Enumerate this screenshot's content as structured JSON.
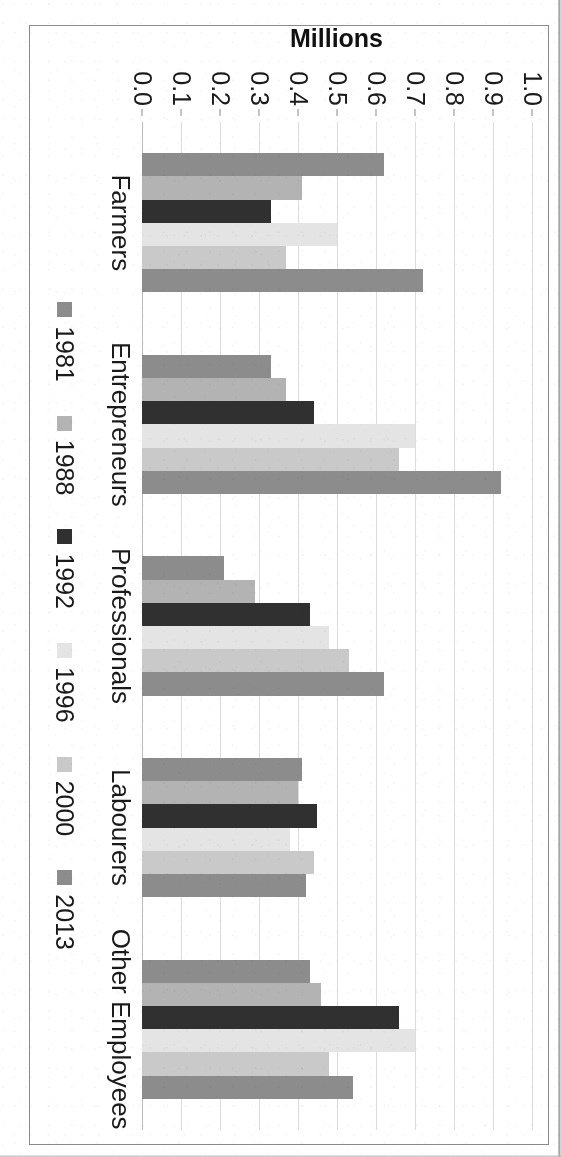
{
  "chart_data": {
    "type": "bar",
    "orientation": "vertical-bars-grouped",
    "title": "",
    "xlabel": "",
    "ylabel": "Millions",
    "ylim": [
      0.0,
      1.0
    ],
    "ytick_labels": [
      "1.0",
      "0.9",
      "0.8",
      "0.7",
      "0.6",
      "0.5",
      "0.4",
      "0.3",
      "0.2",
      "0.1",
      "0.0"
    ],
    "ytick_values": [
      1.0,
      0.9,
      0.8,
      0.7,
      0.6,
      0.5,
      0.4,
      0.3,
      0.2,
      0.1,
      0.0
    ],
    "grid": true,
    "legend_position": "bottom",
    "categories": [
      "Farmers",
      "Entrepreneurs",
      "Professionals",
      "Labourers",
      "Other Employees"
    ],
    "series": [
      {
        "name": "1981",
        "color": "#8c8c8c",
        "values": [
          0.62,
          0.33,
          0.21,
          0.41,
          0.43
        ]
      },
      {
        "name": "1988",
        "color": "#b3b3b3",
        "values": [
          0.41,
          0.37,
          0.29,
          0.4,
          0.46
        ]
      },
      {
        "name": "1992",
        "color": "#303030",
        "values": [
          0.33,
          0.44,
          0.43,
          0.45,
          0.66
        ]
      },
      {
        "name": "1996",
        "color": "#e4e4e4",
        "values": [
          0.5,
          0.7,
          0.48,
          0.38,
          0.7
        ]
      },
      {
        "name": "2000",
        "color": "#c9c9c9",
        "values": [
          0.37,
          0.66,
          0.53,
          0.44,
          0.48
        ]
      },
      {
        "name": "2013",
        "color": "#8c8c8c",
        "values": [
          0.72,
          0.92,
          0.62,
          0.42,
          0.54
        ]
      }
    ],
    "data_labels": [
      {
        "category": "Farmers",
        "series": "1981",
        "text": "0.6"
      },
      {
        "category": "Farmers",
        "series": "2013",
        "text": "0.7"
      },
      {
        "category": "Entrepreneurs",
        "series": "1981",
        "text": "0.3"
      },
      {
        "category": "Entrepreneurs",
        "series": "2013",
        "text": "0.9"
      },
      {
        "category": "Professionals",
        "series": "1981",
        "text": "0.2"
      },
      {
        "category": "Professionals",
        "series": "2013",
        "text": "0.6"
      },
      {
        "category": "Labourers",
        "series": "1981",
        "text": "0.4"
      },
      {
        "category": "Labourers",
        "series": "2013",
        "text": "0.4"
      },
      {
        "category": "Other Employees",
        "series": "1981",
        "text": "0.4"
      },
      {
        "category": "Other Employees",
        "series": "2013",
        "text": "0.5"
      }
    ]
  },
  "axis": {
    "y_title": "Millions",
    "ticks": [
      "1.0",
      "0.9",
      "0.8",
      "0.7",
      "0.6",
      "0.5",
      "0.4",
      "0.3",
      "0.2",
      "0.1",
      "0.0"
    ]
  },
  "categories": [
    {
      "label": "Farmers"
    },
    {
      "label": "Entrepreneurs"
    },
    {
      "label": "Professionals"
    },
    {
      "label": "Labourers"
    },
    {
      "label": "Other Employees"
    }
  ],
  "legend": {
    "items": [
      {
        "label": "1981",
        "color": "#8c8c8c"
      },
      {
        "label": "1988",
        "color": "#b3b3b3"
      },
      {
        "label": "1992",
        "color": "#303030"
      },
      {
        "label": "1996",
        "color": "#e4e4e4"
      },
      {
        "label": "2000",
        "color": "#c9c9c9"
      },
      {
        "label": "2013",
        "color": "#8c8c8c"
      }
    ]
  },
  "caption": {
    "stub_text": ""
  },
  "colors": {
    "page_background": "#ffffff",
    "frame_border": "#8a8a8a",
    "gridline": "#dcdcdc",
    "text": "#1a1a1a"
  }
}
